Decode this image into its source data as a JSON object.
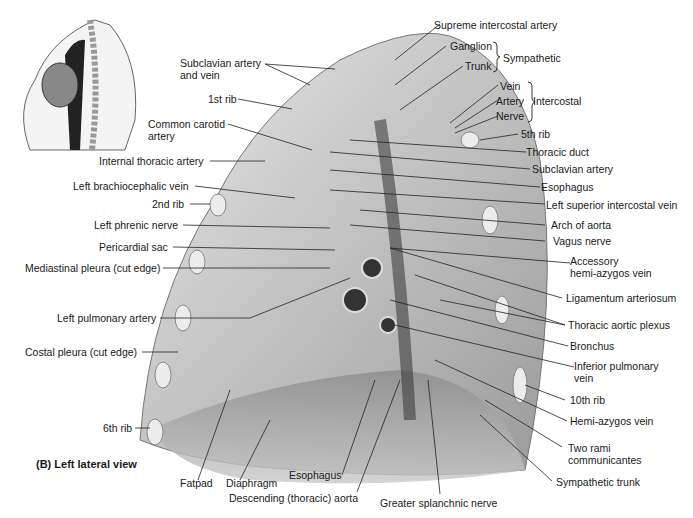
{
  "figure": {
    "caption": "(B) Left lateral view",
    "inset": "Sagittal orientation sketch of thorax showing heart, aorta and vertebral column"
  },
  "labels_left": [
    {
      "id": "subclavian-artery-and-vein",
      "text": "Subclavian artery",
      "text2": "and vein"
    },
    {
      "id": "1st-rib",
      "text": "1st rib"
    },
    {
      "id": "common-carotid-artery",
      "text": "Common carotid",
      "text2": "artery"
    },
    {
      "id": "internal-thoracic-artery",
      "text": "Internal thoracic artery"
    },
    {
      "id": "left-brachiocephalic-vein",
      "text": "Left brachiocephalic vein"
    },
    {
      "id": "2nd-rib",
      "text": "2nd rib"
    },
    {
      "id": "left-phrenic-nerve",
      "text": "Left phrenic nerve"
    },
    {
      "id": "pericardial-sac",
      "text": "Pericardial sac"
    },
    {
      "id": "mediastinal-pleura",
      "text": "Mediastinal pleura (cut edge)"
    },
    {
      "id": "left-pulmonary-artery",
      "text": "Left pulmonary artery"
    },
    {
      "id": "costal-pleura",
      "text": "Costal pleura (cut edge)"
    },
    {
      "id": "6th-rib",
      "text": "6th rib"
    }
  ],
  "labels_right": [
    {
      "id": "supreme-intercostal-artery",
      "text": "Supreme intercostal artery"
    },
    {
      "id": "ganglion",
      "text": "Ganglion"
    },
    {
      "id": "trunk",
      "text": "Trunk"
    },
    {
      "id": "sympathetic",
      "text": "Sympathetic"
    },
    {
      "id": "vein",
      "text": "Vein"
    },
    {
      "id": "artery",
      "text": "Artery"
    },
    {
      "id": "nerve",
      "text": "Nerve"
    },
    {
      "id": "intercostal",
      "text": "Intercostal"
    },
    {
      "id": "5th-rib",
      "text": "5th rib"
    },
    {
      "id": "thoracic-duct",
      "text": "Thoracic duct"
    },
    {
      "id": "subclavian-artery",
      "text": "Subclavian artery"
    },
    {
      "id": "esophagus-right",
      "text": "Esophagus"
    },
    {
      "id": "left-superior-intercostal-vein",
      "text": "Left superior intercostal vein"
    },
    {
      "id": "arch-of-aorta",
      "text": "Arch of aorta"
    },
    {
      "id": "vagus-nerve",
      "text": "Vagus nerve"
    },
    {
      "id": "accessory-hemi-azygos-vein",
      "text": "Accessory",
      "text2": "hemi-azygos vein"
    },
    {
      "id": "ligamentum-arteriosum",
      "text": "Ligamentum arteriosum"
    },
    {
      "id": "thoracic-aortic-plexus",
      "text": "Thoracic aortic plexus"
    },
    {
      "id": "bronchus",
      "text": "Bronchus"
    },
    {
      "id": "inferior-pulmonary-vein",
      "text": "Inferior pulmonary",
      "text2": "vein"
    },
    {
      "id": "10th-rib",
      "text": "10th rib"
    },
    {
      "id": "hemi-azygos-vein",
      "text": "Hemi-azygos vein"
    },
    {
      "id": "two-rami-communicantes",
      "text": "Two rami",
      "text2": "communicantes"
    },
    {
      "id": "sympathetic-trunk",
      "text": "Sympathetic trunk"
    }
  ],
  "labels_bottom": [
    {
      "id": "fatpad",
      "text": "Fatpad"
    },
    {
      "id": "diaphragm",
      "text": "Diaphragm"
    },
    {
      "id": "esophagus-bottom",
      "text": "Esophagus"
    },
    {
      "id": "descending-aorta",
      "text": "Descending (thoracic) aorta"
    },
    {
      "id": "greater-splanchnic-nerve",
      "text": "Greater splanchnic nerve"
    }
  ]
}
